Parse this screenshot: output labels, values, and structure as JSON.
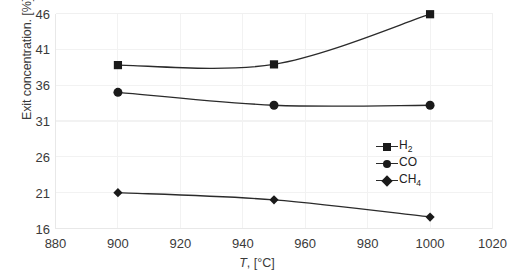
{
  "chart_data": {
    "type": "line",
    "title": "",
    "xlabel": "T, [°C]",
    "ylabel": "Exit concentration. [%]",
    "x": [
      900,
      950,
      1000
    ],
    "xlim": [
      880,
      1020
    ],
    "ylim": [
      16,
      46
    ],
    "xticks": [
      "880",
      "900",
      "920",
      "940",
      "960",
      "980",
      "1000",
      "1020"
    ],
    "yticks": [
      "46",
      "41",
      "36",
      "31",
      "26",
      "21",
      "16"
    ],
    "xtick_values": [
      880,
      900,
      920,
      940,
      960,
      980,
      1000,
      1020
    ],
    "ytick_values": [
      46,
      41,
      36,
      31,
      26,
      21,
      16
    ],
    "grid": true,
    "legend_position": "inside-right",
    "series": [
      {
        "name": "H₂",
        "marker": "square",
        "values": [
          38.8,
          38.9,
          45.9
        ]
      },
      {
        "name": "CO",
        "marker": "circle",
        "values": [
          35.0,
          33.2,
          33.2
        ]
      },
      {
        "name": "CH₄",
        "marker": "diamond",
        "values": [
          21.0,
          20.0,
          17.6
        ]
      }
    ]
  },
  "axis": {
    "ylabel_text": "Exit concentration. [%]",
    "xlabel_t": "T",
    "xlabel_rest": ", [°C]"
  },
  "legend": {
    "items": [
      {
        "label_html": "H2",
        "label": "H₂",
        "base": "H",
        "sub": "2"
      },
      {
        "label_html": "CO",
        "label": "CO",
        "base": "CO",
        "sub": ""
      },
      {
        "label_html": "CH4",
        "label": "CH₄",
        "base": "CH",
        "sub": "4"
      }
    ]
  },
  "colors": {
    "line": "#2b2b2b",
    "marker": "#1a1a1a",
    "grid": "#f2f2f2",
    "axis": "#f0f0f0",
    "text": "#3a3a3a"
  }
}
